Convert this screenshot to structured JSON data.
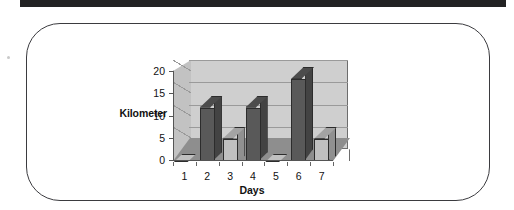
{
  "header_band": {
    "name": "top-black-band",
    "color": "#222223"
  },
  "figure": {
    "border_color": "#3b3b3f",
    "background": "#ffffff"
  },
  "chart_data": {
    "type": "bar",
    "title": "",
    "subtitle": "",
    "xlabel": "Days",
    "ylabel": "Kilometer",
    "categories": [
      "1",
      "2",
      "3",
      "4",
      "5",
      "6",
      "7"
    ],
    "values": [
      0,
      12,
      5,
      12,
      0,
      18.5,
      5
    ],
    "ytick_labels": [
      "0",
      "5",
      "10",
      "15",
      "20"
    ],
    "ytick_values": [
      0,
      5,
      10,
      15,
      20
    ],
    "ylim": [
      0,
      20
    ],
    "grid": true,
    "legend": "none",
    "three_d": true,
    "bar_colors": [
      "#c0c0c0",
      "#595959",
      "#c0c0c0",
      "#595959",
      "#c0c0c0",
      "#595959",
      "#c0c0c0"
    ],
    "plot_background": "#cfcfcf",
    "floor_color": "#8e8e8e",
    "gridline_color": "#9a9a9a",
    "bar_outline_color": "#2c2c2c"
  }
}
